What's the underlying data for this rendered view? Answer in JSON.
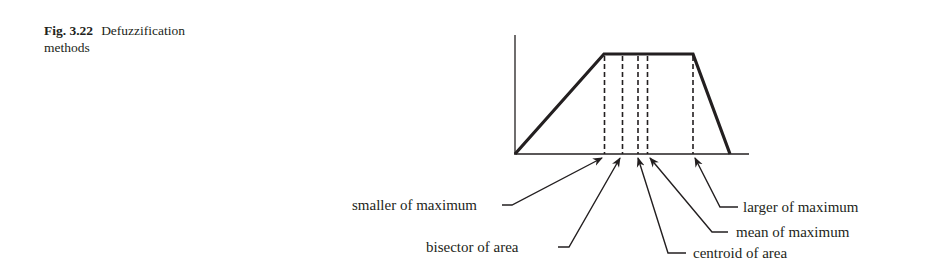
{
  "caption": {
    "number": "Fig. 3.22",
    "title": "Defuzzification",
    "title_line2": "methods"
  },
  "figure": {
    "type": "diagram",
    "labels": {
      "smaller_of_maximum": "smaller of maximum",
      "bisector_of_area": "bisector of area",
      "centroid_of_area": "centroid of area",
      "mean_of_maximum": "mean of maximum",
      "larger_of_maximum": "larger of maximum"
    },
    "colors": {
      "ink": "#231f20",
      "background": "#ffffff"
    }
  }
}
